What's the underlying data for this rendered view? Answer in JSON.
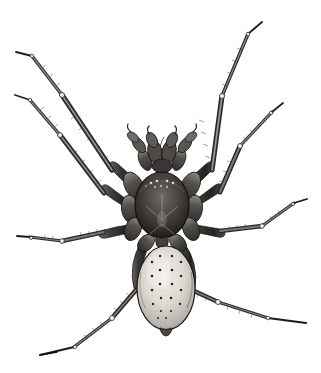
{
  "page": {
    "background_color": "#ffffff",
    "ink_color": "#2b2b2b",
    "width": 321,
    "height": 373
  },
  "header": {
    "running_head_fragment": "· ········ ······· ·········· ····· ··· ·· ·····",
    "legible": false,
    "note": "cropped faded running text at top margin"
  },
  "figure": {
    "view": "dorsal",
    "technique": "engraving / stipple line illustration",
    "leg_count": 8,
    "palpi_count": 2,
    "body_parts": [
      {
        "name": "cephalothorax",
        "shape": "oval",
        "shade": "dark",
        "cx": 162,
        "cy": 205,
        "rx": 27,
        "ry": 33
      },
      {
        "name": "abdomen",
        "shape": "ovoid",
        "shade": "light-stippled",
        "cx": 166,
        "cy": 288,
        "rx": 29,
        "ry": 42
      },
      {
        "name": "pedicel",
        "shape": "narrow-waist",
        "cx": 163,
        "cy": 243
      },
      {
        "name": "chelicerae",
        "shape": "paired-claws",
        "cx": 162,
        "cy": 150
      }
    ],
    "eye_count": 8,
    "abdomen_spot_columns": 4,
    "legs": [
      {
        "id": "L1",
        "side": "left",
        "label": "front-left-leg",
        "tip_x": 16,
        "tip_y": 52
      },
      {
        "id": "L2",
        "side": "left",
        "label": "second-left-leg",
        "tip_x": 14,
        "tip_y": 132
      },
      {
        "id": "L3",
        "side": "left",
        "label": "third-left-leg",
        "tip_x": 17,
        "tip_y": 236
      },
      {
        "id": "L4",
        "side": "left",
        "label": "hind-left-leg",
        "tip_x": 40,
        "tip_y": 355
      },
      {
        "id": "R1",
        "side": "right",
        "label": "front-right-leg",
        "tip_x": 262,
        "tip_y": 22
      },
      {
        "id": "R2",
        "side": "right",
        "label": "second-right-leg",
        "tip_x": 283,
        "tip_y": 103
      },
      {
        "id": "R3",
        "side": "right",
        "label": "third-right-leg",
        "tip_x": 307,
        "tip_y": 199
      },
      {
        "id": "R4",
        "side": "right",
        "label": "hind-right-leg",
        "tip_x": 306,
        "tip_y": 323
      }
    ]
  },
  "caption": {
    "text": "",
    "present": false
  }
}
